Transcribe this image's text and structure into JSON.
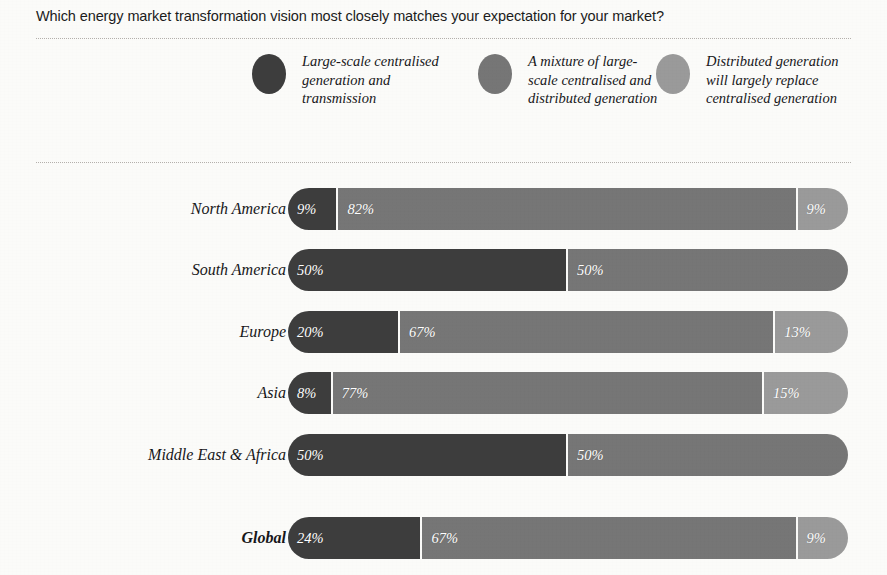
{
  "title": "Which energy market transformation vision most closely matches your expectation for your market?",
  "colors": {
    "background": "#fbfbf9",
    "series_dark": "#3d3d3d",
    "series_medium": "#767676",
    "series_light": "#9a9a9a",
    "label_text": "#17171a",
    "bar_label_text": "#ffffff",
    "divider": "#b4b0ac"
  },
  "legend": {
    "items": [
      {
        "label": "Large-scale centralised generation and transmission",
        "color": "#3d3d3d",
        "icon": "legend-circle-icon"
      },
      {
        "label": "A mixture of large-scale centralised and distributed generation",
        "color": "#767676",
        "icon": "legend-circle-icon"
      },
      {
        "label": "Distributed generation will largely replace centralised generation",
        "color": "#9a9a9a",
        "icon": "legend-circle-icon"
      }
    ]
  },
  "chart_data": {
    "type": "bar",
    "orientation": "horizontal",
    "stacked": true,
    "stack_total": 100,
    "title": "Which energy market transformation vision most closely matches your expectation for your market?",
    "xlabel": "",
    "ylabel": "",
    "xlim": [
      0,
      100
    ],
    "grid": false,
    "legend_position": "top",
    "value_suffix": "%",
    "categories": [
      "North America",
      "South America",
      "Europe",
      "Asia",
      "Middle East & Africa",
      "Global"
    ],
    "series": [
      {
        "name": "Large-scale centralised generation and transmission",
        "color": "#3d3d3d",
        "values": [
          9,
          50,
          20,
          8,
          50,
          24
        ],
        "labels": [
          "9%",
          "50%",
          "20%",
          "8%",
          "50%",
          "24%"
        ]
      },
      {
        "name": "A mixture of large-scale centralised and distributed generation",
        "color": "#767676",
        "values": [
          82,
          50,
          67,
          77,
          50,
          67
        ],
        "labels": [
          "82%",
          "50%",
          "67%",
          "77%",
          "50%",
          "67%"
        ]
      },
      {
        "name": "Distributed generation will largely replace centralised generation",
        "color": "#9a9a9a",
        "values": [
          9,
          0,
          13,
          15,
          0,
          9
        ],
        "labels": [
          "9%",
          "",
          "13%",
          "15%",
          "",
          "9%"
        ]
      }
    ]
  },
  "rows": [
    {
      "label": "North America",
      "emphasis": false,
      "top": 188,
      "segments": [
        {
          "value": 9,
          "label": "9%",
          "color": "#3d3d3d"
        },
        {
          "value": 82,
          "label": "82%",
          "color": "#767676"
        },
        {
          "value": 9,
          "label": "9%",
          "color": "#9a9a9a"
        }
      ]
    },
    {
      "label": "South America",
      "emphasis": false,
      "top": 249,
      "segments": [
        {
          "value": 50,
          "label": "50%",
          "color": "#3d3d3d"
        },
        {
          "value": 50,
          "label": "50%",
          "color": "#767676"
        }
      ]
    },
    {
      "label": "Europe",
      "emphasis": false,
      "top": 311,
      "segments": [
        {
          "value": 20,
          "label": "20%",
          "color": "#3d3d3d"
        },
        {
          "value": 67,
          "label": "67%",
          "color": "#767676"
        },
        {
          "value": 13,
          "label": "13%",
          "color": "#9a9a9a"
        }
      ]
    },
    {
      "label": "Asia",
      "emphasis": false,
      "top": 372,
      "segments": [
        {
          "value": 8,
          "label": "8%",
          "color": "#3d3d3d"
        },
        {
          "value": 77,
          "label": "77%",
          "color": "#767676"
        },
        {
          "value": 15,
          "label": "15%",
          "color": "#9a9a9a"
        }
      ]
    },
    {
      "label": "Middle East & Africa",
      "emphasis": false,
      "top": 434,
      "segments": [
        {
          "value": 50,
          "label": "50%",
          "color": "#3d3d3d"
        },
        {
          "value": 50,
          "label": "50%",
          "color": "#767676"
        }
      ]
    },
    {
      "label": "Global",
      "emphasis": true,
      "top": 517,
      "segments": [
        {
          "value": 24,
          "label": "24%",
          "color": "#3d3d3d"
        },
        {
          "value": 67,
          "label": "67%",
          "color": "#767676"
        },
        {
          "value": 9,
          "label": "9%",
          "color": "#9a9a9a"
        }
      ]
    }
  ]
}
